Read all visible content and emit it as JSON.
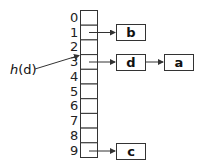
{
  "diagram": {
    "type": "hash-table-chaining",
    "table": {
      "indices": [
        "0",
        "1",
        "2",
        "3",
        "4",
        "5",
        "6",
        "7",
        "8",
        "9"
      ]
    },
    "chains": [
      {
        "slot": 1,
        "nodes": [
          "b"
        ]
      },
      {
        "slot": 3,
        "nodes": [
          "d",
          "a"
        ]
      },
      {
        "slot": 9,
        "nodes": [
          "c"
        ]
      }
    ],
    "hash_label": {
      "func": "h",
      "arg": "(d)",
      "points_to_slot": 3
    },
    "colors": {
      "stroke": "#333333",
      "text": "#111111",
      "background": "#ffffff"
    }
  }
}
